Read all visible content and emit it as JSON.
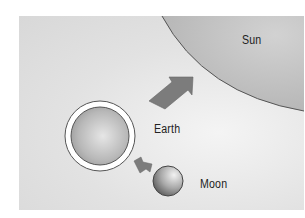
{
  "diagram": {
    "labels": {
      "sun": "Sun",
      "earth": "Earth",
      "moon": "Moon"
    },
    "colors": {
      "background": "#e2e2e2",
      "sun_fill": "#bdbdbd",
      "earth_fill": "#b0b0b0",
      "earth_ring": "#ffffff",
      "moon_fill": "#9a9a9a",
      "arrow_fill": "#7c7c7c",
      "outline": "#444444"
    },
    "arrows": [
      {
        "from": "earth",
        "to": "sun",
        "size": "large"
      },
      {
        "from": "earth",
        "to": "moon",
        "size": "small"
      }
    ]
  }
}
